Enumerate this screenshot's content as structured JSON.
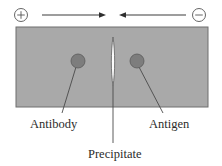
{
  "figure": {
    "background_color": "#ffffff"
  },
  "electrodes": {
    "positive": {
      "symbol": "+",
      "name": "anode-positive-electrode",
      "cx": 21,
      "cy": 15,
      "r": 6.5
    },
    "negative": {
      "symbol": "−",
      "name": "cathode-negative-electrode",
      "cx": 199,
      "cy": 15,
      "r": 6.5
    }
  },
  "arrows": {
    "left": {
      "label": "migration-arrow-rightward",
      "x1": 42,
      "x2": 106,
      "y": 15,
      "direction": "right"
    },
    "right": {
      "label": "migration-arrow-leftward",
      "x1": 186,
      "x2": 119,
      "y": 15,
      "direction": "left"
    }
  },
  "gel": {
    "name": "agarose-gel-plate",
    "x": 16,
    "y": 27,
    "width": 192,
    "height": 80,
    "fill": "#a9a9a9",
    "stroke": "#6f6f6f"
  },
  "precipitate": {
    "name": "precipitate-band",
    "cx": 113,
    "top": 37,
    "bottom": 86,
    "half_width": 2.2,
    "fill": "#fbfbfb",
    "stroke": "#5e5e5e"
  },
  "spots": [
    {
      "key": "antibody",
      "label": "Antibody",
      "cx": 78,
      "cy": 61,
      "r": 7,
      "fill": "#7d7d7d",
      "stroke": "#5a5a5a",
      "leader": {
        "x1": 76,
        "y1": 67,
        "x2": 62,
        "y2": 113
      },
      "label_x": 30,
      "label_y": 128
    },
    {
      "key": "antigen",
      "label": "Antigen",
      "cx": 137,
      "cy": 61,
      "r": 7,
      "fill": "#7d7d7d",
      "stroke": "#5a5a5a",
      "leader": {
        "x1": 139,
        "y1": 67,
        "x2": 163,
        "y2": 113
      },
      "label_x": 149,
      "label_y": 128
    }
  ],
  "precipitate_label": {
    "text": "Precipitate",
    "x": 88,
    "y": 158,
    "leader": {
      "x1": 113,
      "y1": 86,
      "x2": 113,
      "y2": 143
    }
  },
  "colors": {
    "gel_fill": "#a9a9a9",
    "gel_border": "#6f6f6f",
    "spot_fill": "#7d7d7d",
    "line": "#4a4a4a",
    "text": "#2b2b2b"
  }
}
